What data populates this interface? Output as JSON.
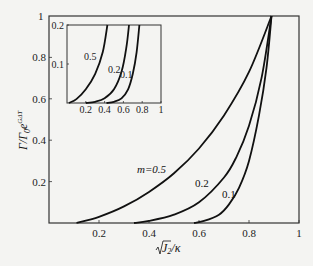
{
  "chart_data": [
    {
      "type": "line",
      "title": "",
      "xlabel": "√J₂/κ",
      "ylabel": "Γ/Γ₀e^(GΔT)",
      "xlim": [
        0,
        1
      ],
      "ylim": [
        0,
        1
      ],
      "xticks": [
        "0.2",
        "0.4",
        "0.6",
        "0.8",
        "1"
      ],
      "yticks": [
        "0.2",
        "0.4",
        "0.6",
        "0.8",
        "1"
      ],
      "grid": false,
      "series": [
        {
          "name": "m=0.5",
          "label": "m=0.5",
          "x": [
            0.11,
            0.2,
            0.3,
            0.4,
            0.5,
            0.6,
            0.7,
            0.8,
            0.89
          ],
          "y": [
            0.0,
            0.03,
            0.08,
            0.15,
            0.24,
            0.36,
            0.52,
            0.73,
            1.0
          ]
        },
        {
          "name": "m=0.2",
          "label": "0.2",
          "x": [
            0.34,
            0.4,
            0.5,
            0.6,
            0.7,
            0.75,
            0.8,
            0.85,
            0.89
          ],
          "y": [
            0.0,
            0.01,
            0.04,
            0.1,
            0.22,
            0.32,
            0.47,
            0.7,
            1.0
          ]
        },
        {
          "name": "m=0.1",
          "label": "0.1",
          "x": [
            0.58,
            0.62,
            0.68,
            0.72,
            0.76,
            0.8,
            0.84,
            0.87,
            0.89
          ],
          "y": [
            0.0,
            0.01,
            0.04,
            0.09,
            0.17,
            0.3,
            0.52,
            0.75,
            1.0
          ]
        }
      ]
    },
    {
      "type": "line",
      "title": "inset",
      "xlim": [
        0,
        1
      ],
      "ylim": [
        0,
        0.2
      ],
      "xticks": [
        "0.2",
        "0.4",
        "0.6",
        "0.8",
        "1"
      ],
      "yticks": [
        "0.1",
        "0.2"
      ],
      "series": [
        {
          "name": "m=0.5",
          "label": "0.5",
          "x": [
            0.02,
            0.1,
            0.2,
            0.3,
            0.38,
            0.43
          ],
          "y": [
            0.0,
            0.01,
            0.035,
            0.075,
            0.13,
            0.2
          ]
        },
        {
          "name": "m=0.2",
          "label": "0.2",
          "x": [
            0.2,
            0.3,
            0.4,
            0.5,
            0.58,
            0.63,
            0.66
          ],
          "y": [
            0.0,
            0.003,
            0.012,
            0.035,
            0.08,
            0.14,
            0.2
          ]
        },
        {
          "name": "m=0.1",
          "label": "0.1",
          "x": [
            0.42,
            0.5,
            0.58,
            0.65,
            0.7,
            0.74,
            0.77
          ],
          "y": [
            0.0,
            0.003,
            0.012,
            0.035,
            0.075,
            0.13,
            0.2
          ]
        }
      ]
    }
  ],
  "labels": {
    "y_top_tick": "1",
    "x_axis_label": "√J₂/κ",
    "y_axis_label": "Γ/Γ₀e^GΔT",
    "main_m05": "m=0.5",
    "main_m02": "0.2",
    "main_m01": "0.1",
    "inset_m05": "0.5",
    "inset_m02": "0.2",
    "inset_m01": "0.1"
  }
}
